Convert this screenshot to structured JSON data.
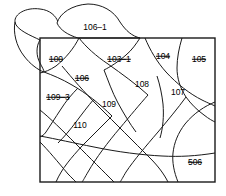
{
  "figure": {
    "type": "cadastral-parcel-diagram",
    "background_color": "#ffffff",
    "line_color": "#1a1a1a",
    "border": {
      "x": 40,
      "y": 38,
      "width": 175,
      "height": 144
    },
    "labels": [
      {
        "id": "label-106-1",
        "text": "106–1",
        "x": 95,
        "y": 27,
        "struck": false
      },
      {
        "id": "label-100",
        "text": "100",
        "x": 56,
        "y": 59,
        "struck": true
      },
      {
        "id": "label-103-1",
        "text": "103–1",
        "x": 119,
        "y": 59,
        "struck": true
      },
      {
        "id": "label-104",
        "text": "104",
        "x": 163,
        "y": 56,
        "struck": true
      },
      {
        "id": "label-105",
        "text": "105",
        "x": 199,
        "y": 59,
        "struck": true
      },
      {
        "id": "label-106",
        "text": "106",
        "x": 82,
        "y": 78,
        "struck": true
      },
      {
        "id": "label-108",
        "text": "108",
        "x": 142,
        "y": 84,
        "struck": false
      },
      {
        "id": "label-107",
        "text": "107",
        "x": 178,
        "y": 92,
        "struck": false
      },
      {
        "id": "label-109-3",
        "text": "109–3",
        "x": 58,
        "y": 97,
        "struck": true
      },
      {
        "id": "label-109",
        "text": "109",
        "x": 109,
        "y": 104,
        "struck": false
      },
      {
        "id": "label-110",
        "text": "110",
        "x": 80,
        "y": 125,
        "struck": false
      },
      {
        "id": "label-506",
        "text": "506",
        "x": 195,
        "y": 162,
        "struck": true
      }
    ]
  }
}
